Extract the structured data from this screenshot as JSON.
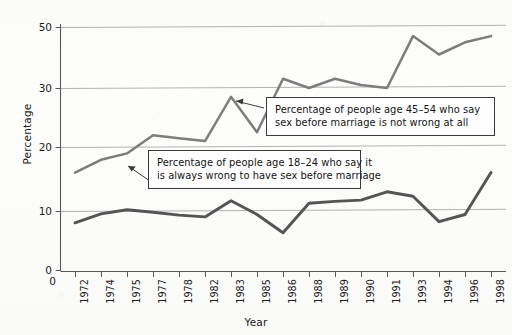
{
  "chart_data": {
    "type": "line",
    "title": "",
    "xlabel": "Year",
    "ylabel": "Percentage",
    "grid": true,
    "legend_position": "annotations",
    "xlim": [
      1972,
      1998
    ],
    "ylim": [
      0,
      50
    ],
    "ytick_labels": [
      "0",
      "10",
      "20",
      "30",
      "50"
    ],
    "ytick_values": [
      0,
      10,
      20,
      30,
      50
    ],
    "gridlines": [
      10,
      20,
      30,
      50
    ],
    "categories": [
      "1972",
      "1974",
      "1975",
      "1977",
      "1978",
      "1982",
      "1983",
      "1985",
      "1986",
      "1988",
      "1989",
      "1990",
      "1991",
      "1993",
      "1994",
      "1996",
      "1998"
    ],
    "series": [
      {
        "name": "Percentage of people age 45–54 who say sex before marriage is not wrong at all",
        "short_name": "age-45-54-not-wrong-at-all",
        "color": "#7d7d7d",
        "values": [
          16,
          18,
          19,
          22,
          21.5,
          21,
          28.5,
          22.5,
          33,
          30,
          33,
          31,
          30,
          47,
          41,
          45,
          47
        ]
      },
      {
        "name": "Percentage of people age 18–24 who say it is always wrong to have sex before marriage",
        "short_name": "age-18-24-always-wrong",
        "color": "#555555",
        "values": [
          8,
          9.5,
          10.2,
          9.8,
          9.3,
          9,
          11.6,
          9.4,
          6.3,
          11.2,
          11.5,
          11.7,
          13,
          12.3,
          8.2,
          9.4,
          16
        ]
      }
    ],
    "annotations": [
      {
        "id": "callout-4554",
        "line1": "Percentage of people age 45–54 who say",
        "line2": "sex before marriage is not wrong at all",
        "points_to_series": "age-45-54-not-wrong-at-all"
      },
      {
        "id": "callout-1824",
        "line1": "Percentage of people age 18–24 who say it",
        "line2": "is always wrong to have sex before marriage",
        "points_to_series": "age-18-24-always-wrong"
      }
    ]
  },
  "axes": {
    "y_title": "Percentage",
    "x_title": "Year",
    "y_ticks": [
      {
        "label": "50",
        "top": 22
      },
      {
        "label": "30",
        "top": 83
      },
      {
        "label": "20",
        "top": 142
      },
      {
        "label": "10",
        "top": 206
      },
      {
        "label": "0",
        "top": 265
      }
    ],
    "x_ticks": [
      {
        "label": "1972",
        "x": 75
      },
      {
        "label": "1974",
        "x": 101
      },
      {
        "label": "1975",
        "x": 127
      },
      {
        "label": "1977",
        "x": 153
      },
      {
        "label": "1978",
        "x": 179
      },
      {
        "label": "1982",
        "x": 205
      },
      {
        "label": "1983",
        "x": 231
      },
      {
        "label": "1985",
        "x": 257
      },
      {
        "label": "1986",
        "x": 283
      },
      {
        "label": "1988",
        "x": 309
      },
      {
        "label": "1989",
        "x": 335
      },
      {
        "label": "1990",
        "x": 361
      },
      {
        "label": "1991",
        "x": 387
      },
      {
        "label": "1993",
        "x": 413
      },
      {
        "label": "1994",
        "x": 439
      },
      {
        "label": "1996",
        "x": 465
      },
      {
        "label": "1998",
        "x": 491
      }
    ],
    "origin_zero_label": "0"
  },
  "colors": {
    "axis": "#4d4d4d",
    "gridline": "#b3b3b3",
    "series_upper": "#7d7d7d",
    "series_lower": "#555555",
    "callout_border": "#3a3a3a",
    "text": "#1a1a1a",
    "background": "#fdfdfc"
  }
}
